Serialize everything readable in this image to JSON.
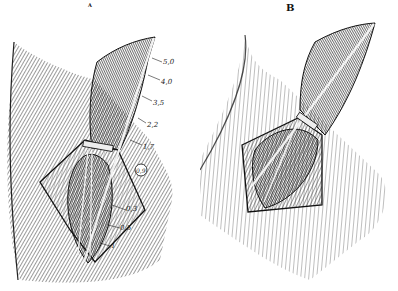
{
  "figure": {
    "panels": [
      {
        "id": "A",
        "label": "A",
        "measurements": [
          "5,0",
          "4,0",
          "3,5",
          "2,2",
          "1,7",
          "0,9",
          "0,3",
          "0,5",
          "1"
        ]
      },
      {
        "id": "B",
        "label": "B"
      }
    ],
    "colors": {
      "ink": "#1a1a1a",
      "paper": "#ffffff",
      "highlight": "#f2f2f2"
    }
  }
}
